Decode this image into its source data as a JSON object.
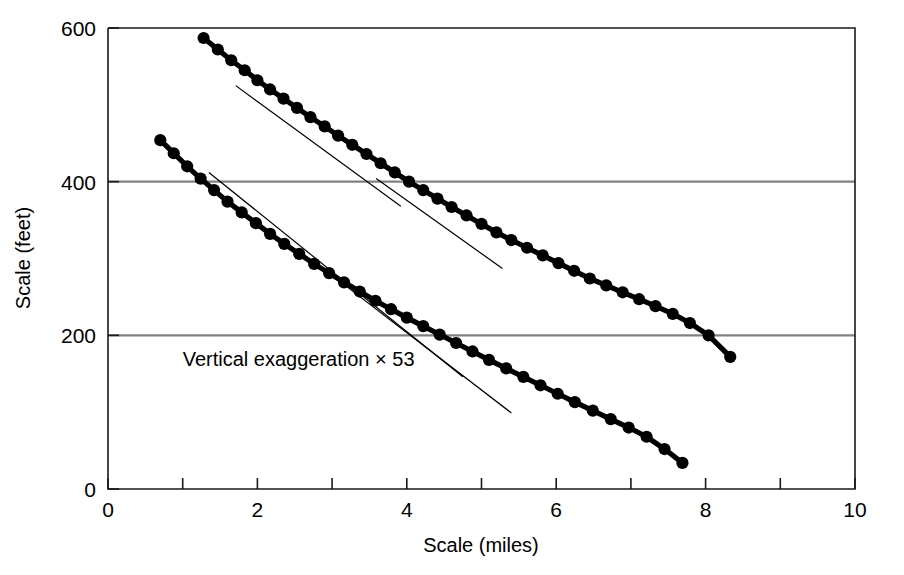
{
  "chart_data": {
    "type": "scatter",
    "title": "",
    "xlabel": "Scale (miles)",
    "ylabel": "Scale (feet)",
    "xlim": [
      0,
      10
    ],
    "ylim": [
      0,
      600
    ],
    "xticks": [
      0,
      1,
      2,
      3,
      4,
      5,
      6,
      7,
      8,
      9,
      10
    ],
    "xtick_labels": [
      "0",
      "",
      "2",
      "",
      "4",
      "",
      "6",
      "",
      "8",
      "",
      "10"
    ],
    "yticks": [
      0,
      200,
      400,
      600
    ],
    "ytick_labels": [
      "0",
      "200",
      "400",
      "600"
    ],
    "grid": "horizontal gridlines at y = 200 and y = 400",
    "gridlines_y": [
      200,
      400
    ],
    "legend": "none",
    "annotations": [
      {
        "text": "Vertical exaggeration × 53",
        "x": 1.0,
        "y": 160
      }
    ],
    "series": [
      {
        "name": "Upper profile",
        "marker": "filled-circle",
        "x": [
          1.28,
          1.47,
          1.65,
          1.83,
          2.0,
          2.17,
          2.35,
          2.53,
          2.71,
          2.9,
          3.08,
          3.27,
          3.46,
          3.65,
          3.84,
          4.03,
          4.22,
          4.41,
          4.6,
          4.8,
          5.0,
          5.2,
          5.4,
          5.61,
          5.82,
          6.03,
          6.24,
          6.45,
          6.67,
          6.89,
          7.11,
          7.33,
          7.56,
          7.79,
          8.04,
          8.33
        ],
        "y": [
          587,
          572,
          558,
          545,
          532,
          520,
          508,
          496,
          484,
          472,
          460,
          448,
          436,
          424,
          412,
          400,
          389,
          378,
          367,
          356,
          345,
          334,
          324,
          314,
          304,
          294,
          284,
          274,
          265,
          256,
          247,
          238,
          228,
          216,
          200,
          172
        ]
      },
      {
        "name": "Lower profile",
        "marker": "filled-circle",
        "x": [
          0.7,
          0.88,
          1.06,
          1.24,
          1.42,
          1.6,
          1.79,
          1.98,
          2.17,
          2.36,
          2.56,
          2.76,
          2.96,
          3.16,
          3.37,
          3.58,
          3.79,
          4.0,
          4.22,
          4.44,
          4.66,
          4.88,
          5.1,
          5.33,
          5.56,
          5.79,
          6.02,
          6.25,
          6.49,
          6.73,
          6.97,
          7.21,
          7.45,
          7.69
        ],
        "y": [
          454,
          437,
          420,
          404,
          389,
          374,
          360,
          346,
          332,
          319,
          306,
          293,
          281,
          269,
          257,
          245,
          234,
          223,
          212,
          201,
          190,
          179,
          168,
          157,
          146,
          135,
          124,
          113,
          102,
          91,
          80,
          68,
          52,
          34
        ]
      }
    ],
    "trend_lines": [
      {
        "name": "upper-trend-1",
        "x1": 1.71,
        "y1": 525,
        "x2": 3.92,
        "y2": 368
      },
      {
        "name": "upper-trend-2",
        "x1": 3.59,
        "y1": 404,
        "x2": 5.28,
        "y2": 287
      },
      {
        "name": "lower-trend-1",
        "x1": 1.35,
        "y1": 412,
        "x2": 4.75,
        "y2": 146
      },
      {
        "name": "lower-trend-2",
        "x1": 2.8,
        "y1": 293,
        "x2": 5.4,
        "y2": 99
      }
    ],
    "colors": {
      "marker": "#000000",
      "curve": "#000000",
      "trend_line": "#000000",
      "gridline": "#808080",
      "axis": "#000000",
      "background": "#ffffff"
    }
  }
}
